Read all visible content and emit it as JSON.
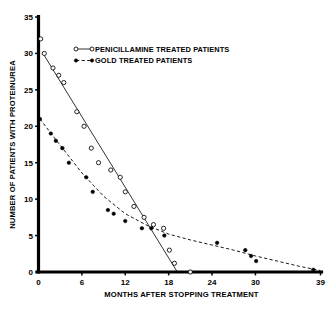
{
  "chart_data": {
    "type": "scatter",
    "title": "",
    "xlabel": "MONTHS AFTER STOPPING TREATMENT",
    "ylabel": "NUMBER OF PATIENTS WITH PROTEINUREA",
    "xlim": [
      0,
      39
    ],
    "ylim": [
      0,
      35
    ],
    "grid": false,
    "legend_position": "top-center",
    "xticks": [
      0,
      6,
      12,
      18,
      24,
      30,
      39
    ],
    "xticklabels": [
      "0",
      "6",
      "12",
      "18",
      "24",
      "30",
      "39"
    ],
    "yticks": [
      0,
      5,
      10,
      15,
      20,
      25,
      30,
      35
    ],
    "yticklabels": [
      "0",
      "5",
      "10",
      "15",
      "20",
      "25",
      "30",
      "35"
    ],
    "series": [
      {
        "name": "PENICILLAMINE TREATED PATIENTS",
        "marker": "open-circle",
        "linestyle": "solid",
        "color": "#000000",
        "points": [
          {
            "x": 0.3,
            "y": 32.0
          },
          {
            "x": 0.8,
            "y": 30.0
          },
          {
            "x": 2.0,
            "y": 28.0
          },
          {
            "x": 2.8,
            "y": 27.0
          },
          {
            "x": 3.5,
            "y": 26.0
          },
          {
            "x": 5.3,
            "y": 22.0
          },
          {
            "x": 6.3,
            "y": 20.0
          },
          {
            "x": 7.3,
            "y": 17.0
          },
          {
            "x": 8.3,
            "y": 15.0
          },
          {
            "x": 10.0,
            "y": 14.0
          },
          {
            "x": 11.3,
            "y": 13.0
          },
          {
            "x": 12.0,
            "y": 11.0
          },
          {
            "x": 13.2,
            "y": 9.0
          },
          {
            "x": 14.6,
            "y": 7.5
          },
          {
            "x": 15.9,
            "y": 6.5
          },
          {
            "x": 17.3,
            "y": 6.0
          },
          {
            "x": 18.1,
            "y": 3.0
          },
          {
            "x": 18.8,
            "y": 1.2
          },
          {
            "x": 21.0,
            "y": 0.0
          }
        ],
        "fit_line": [
          {
            "x": 0.5,
            "y": 30.2
          },
          {
            "x": 19.2,
            "y": 0.0
          }
        ]
      },
      {
        "name": "GOLD TREATED PATIENTS",
        "marker": "filled-circle",
        "linestyle": "dashed",
        "color": "#000000",
        "points": [
          {
            "x": 0.2,
            "y": 21.0
          },
          {
            "x": 1.7,
            "y": 19.0
          },
          {
            "x": 2.4,
            "y": 18.0
          },
          {
            "x": 3.3,
            "y": 17.0
          },
          {
            "x": 4.2,
            "y": 15.0
          },
          {
            "x": 6.6,
            "y": 13.0
          },
          {
            "x": 7.5,
            "y": 11.0
          },
          {
            "x": 9.6,
            "y": 8.5
          },
          {
            "x": 10.4,
            "y": 8.0
          },
          {
            "x": 12.0,
            "y": 7.0
          },
          {
            "x": 14.3,
            "y": 6.0
          },
          {
            "x": 15.6,
            "y": 6.0
          },
          {
            "x": 17.4,
            "y": 5.0
          },
          {
            "x": 24.7,
            "y": 4.0
          },
          {
            "x": 28.6,
            "y": 3.0
          },
          {
            "x": 29.4,
            "y": 2.2
          },
          {
            "x": 30.1,
            "y": 1.5
          },
          {
            "x": 38.0,
            "y": 0.3
          }
        ],
        "fit_curve": [
          {
            "x": 0.2,
            "y": 21.0
          },
          {
            "x": 3.0,
            "y": 17.4
          },
          {
            "x": 6.0,
            "y": 13.6
          },
          {
            "x": 9.0,
            "y": 10.4
          },
          {
            "x": 12.0,
            "y": 8.0
          },
          {
            "x": 15.0,
            "y": 6.4
          },
          {
            "x": 18.0,
            "y": 5.2
          },
          {
            "x": 21.0,
            "y": 4.4
          },
          {
            "x": 24.0,
            "y": 3.7
          },
          {
            "x": 27.0,
            "y": 3.0
          },
          {
            "x": 30.0,
            "y": 2.2
          },
          {
            "x": 33.0,
            "y": 1.5
          },
          {
            "x": 36.0,
            "y": 0.8
          },
          {
            "x": 39.0,
            "y": 0.2
          }
        ]
      }
    ],
    "legend": [
      {
        "label": "PENICILLAMINE TREATED PATIENTS",
        "marker": "open-circle",
        "linestyle": "solid"
      },
      {
        "label": "GOLD TREATED PATIENTS",
        "marker": "filled-circle",
        "linestyle": "dashed"
      }
    ]
  }
}
